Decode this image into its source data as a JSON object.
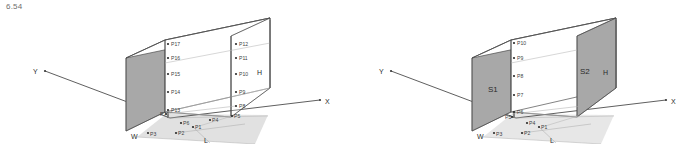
{
  "figure": {
    "caption": "6.54",
    "panels": [
      {
        "id": "left",
        "axes": {
          "x": "X",
          "y": "Y",
          "z": "Z"
        },
        "dimensions": {
          "height": "H",
          "length": "L",
          "width": "W"
        },
        "face_labels": [],
        "points": [
          {
            "id": "P1",
            "label": "P1",
            "x": 193,
            "y": 127,
            "lx": 195,
            "ly": 129
          },
          {
            "id": "P2",
            "label": "P2",
            "x": 176,
            "y": 133,
            "lx": 178,
            "ly": 135
          },
          {
            "id": "P3",
            "label": "P3",
            "x": 148,
            "y": 133,
            "lx": 150,
            "ly": 136
          },
          {
            "id": "P4",
            "label": "P4",
            "x": 210,
            "y": 120,
            "lx": 212,
            "ly": 122
          },
          {
            "id": "P5",
            "label": "P5",
            "x": 232,
            "y": 116,
            "lx": 234,
            "ly": 118
          },
          {
            "id": "P6",
            "label": "P6",
            "x": 181,
            "y": 123,
            "lx": 183,
            "ly": 125
          },
          {
            "id": "P7",
            "label": "P7",
            "x": 166,
            "y": 114,
            "lx": 168,
            "ly": 116
          },
          {
            "id": "P8",
            "label": "P8",
            "x": 236,
            "y": 106,
            "lx": 239,
            "ly": 108
          },
          {
            "id": "P9",
            "label": "P9",
            "x": 236,
            "y": 92,
            "lx": 239,
            "ly": 94
          },
          {
            "id": "P10",
            "label": "P10",
            "x": 236,
            "y": 74,
            "lx": 239,
            "ly": 76
          },
          {
            "id": "P11",
            "label": "P11",
            "x": 236,
            "y": 58,
            "lx": 239,
            "ly": 60
          },
          {
            "id": "P12",
            "label": "P12",
            "x": 236,
            "y": 44,
            "lx": 239,
            "ly": 46
          },
          {
            "id": "P13",
            "label": "P13",
            "x": 168,
            "y": 110,
            "lx": 171,
            "ly": 112
          },
          {
            "id": "P14",
            "label": "P14",
            "x": 168,
            "y": 92,
            "lx": 171,
            "ly": 94
          },
          {
            "id": "P15",
            "label": "P15",
            "x": 168,
            "y": 74,
            "lx": 171,
            "ly": 76
          },
          {
            "id": "P16",
            "label": "P16",
            "x": 168,
            "y": 58,
            "lx": 171,
            "ly": 60
          },
          {
            "id": "P17",
            "label": "P17",
            "x": 168,
            "y": 44,
            "lx": 171,
            "ly": 46
          }
        ]
      },
      {
        "id": "right",
        "axes": {
          "x": "X",
          "y": "Y",
          "z": "Z"
        },
        "dimensions": {
          "height": "H",
          "length": "L",
          "width": "W"
        },
        "face_labels": [
          {
            "id": "S1",
            "label": "S1",
            "x": 147,
            "y": 90
          },
          {
            "id": "S2",
            "label": "S2",
            "x": 238,
            "y": 72
          }
        ],
        "points": [
          {
            "id": "P1",
            "label": "P1",
            "x": 193,
            "y": 127,
            "lx": 195,
            "ly": 129
          },
          {
            "id": "P2",
            "label": "P2",
            "x": 176,
            "y": 133,
            "lx": 178,
            "ly": 135
          },
          {
            "id": "P3",
            "label": "P3",
            "x": 148,
            "y": 133,
            "lx": 150,
            "ly": 136
          },
          {
            "id": "P4",
            "label": "P4",
            "x": 181,
            "y": 123,
            "lx": 183,
            "ly": 125
          },
          {
            "id": "P5",
            "label": "P5",
            "x": 166,
            "y": 117,
            "lx": 165,
            "ly": 119
          },
          {
            "id": "P6",
            "label": "P6",
            "x": 168,
            "y": 112,
            "lx": 171,
            "ly": 114
          },
          {
            "id": "P7",
            "label": "P7",
            "x": 168,
            "y": 95,
            "lx": 171,
            "ly": 97
          },
          {
            "id": "P8",
            "label": "P8",
            "x": 168,
            "y": 76,
            "lx": 171,
            "ly": 78
          },
          {
            "id": "P9",
            "label": "P9",
            "x": 168,
            "y": 58,
            "lx": 171,
            "ly": 60
          },
          {
            "id": "P10",
            "label": "P10",
            "x": 168,
            "y": 43,
            "lx": 171,
            "ly": 45
          }
        ]
      }
    ]
  },
  "style": {
    "shade_fill": "#a8a8a8",
    "floor_fill": "#b8b8b8",
    "line_color": "#4d4d4d",
    "hidden_line_color": "#9a9a9a",
    "axis_color": "#3a3a3a",
    "background": "#ffffff"
  }
}
